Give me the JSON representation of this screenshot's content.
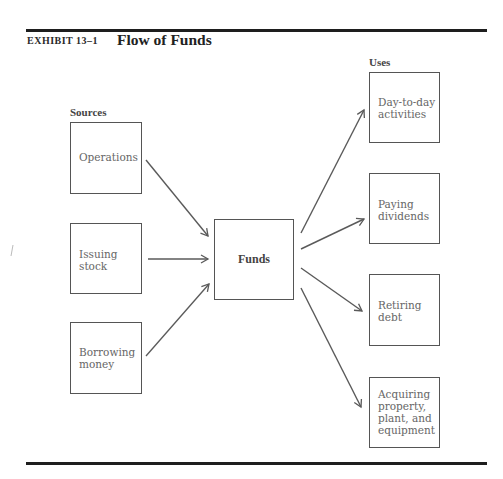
{
  "exhibit": {
    "label": "EXHIBIT 13–1",
    "title": "Flow of Funds"
  },
  "sources": {
    "heading": "Sources",
    "items": [
      {
        "label": "Operations",
        "lines": [
          "Operations"
        ]
      },
      {
        "label": "Issuing stock",
        "lines": [
          "Issuing",
          "stock"
        ]
      },
      {
        "label": "Borrowing money",
        "lines": [
          "Borrowing",
          "money"
        ]
      }
    ]
  },
  "center": {
    "label": "Funds"
  },
  "uses": {
    "heading": "Uses",
    "items": [
      {
        "label": "Day-to-day activities",
        "lines": [
          "Day-to-day",
          "activities"
        ]
      },
      {
        "label": "Paying dividends",
        "lines": [
          "Paying",
          "dividends"
        ]
      },
      {
        "label": "Retiring debt",
        "lines": [
          "Retiring",
          "debt"
        ]
      },
      {
        "label": "Acquiring property, plant, and equipment",
        "lines": [
          "Acquiring",
          "property,",
          "plant, and",
          "equipment"
        ]
      }
    ]
  },
  "edges": [
    {
      "from": "Operations",
      "to": "Funds"
    },
    {
      "from": "Issuing stock",
      "to": "Funds"
    },
    {
      "from": "Borrowing money",
      "to": "Funds"
    },
    {
      "from": "Funds",
      "to": "Day-to-day activities"
    },
    {
      "from": "Funds",
      "to": "Paying dividends"
    },
    {
      "from": "Funds",
      "to": "Retiring debt"
    },
    {
      "from": "Funds",
      "to": "Acquiring property, plant, and equipment"
    }
  ],
  "colors": {
    "rule": "#1e1e1e",
    "box_border": "#555555",
    "arrow": "#5a5a5a",
    "text": "#666666"
  }
}
